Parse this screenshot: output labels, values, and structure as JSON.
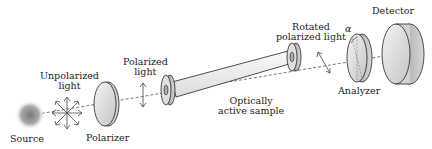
{
  "diagram": {
    "components": [
      {
        "id": "source",
        "label": "Source"
      },
      {
        "id": "unpolarized_light",
        "label_line1": "Unpolarized",
        "label_line2": "light"
      },
      {
        "id": "polarizer",
        "label": "Polarizer"
      },
      {
        "id": "polarized_light",
        "label_line1": "Polarized",
        "label_line2": "light"
      },
      {
        "id": "sample",
        "label_line1": "Optically",
        "label_line2": "active sample"
      },
      {
        "id": "rotated_light",
        "label_line1": "Rotated",
        "label_line2": "polarized light"
      },
      {
        "id": "analyzer",
        "label": "Analyzer",
        "angle_symbol": "α"
      },
      {
        "id": "detector",
        "label": "Detector"
      }
    ],
    "colors": {
      "stroke": "#222222",
      "fill_light": "#e8e8e8",
      "fill_mid": "#bdbdbd",
      "beam": "#555555"
    }
  }
}
